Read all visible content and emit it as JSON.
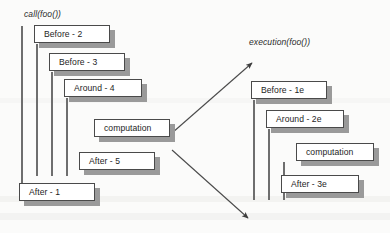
{
  "diagram": {
    "background_color": "#fbfbfa",
    "box_fill": "#ffffff",
    "box_border": "#4a4a4a",
    "shadow_color": "#9a9a9a",
    "lifeline_color": "#6e6e6e",
    "arrow_color": "#4a4a4a"
  },
  "left_group": {
    "caption": "call(foo())",
    "boxes": [
      {
        "label": "Before - 2",
        "x": 34,
        "y": 25,
        "w": 76,
        "h": 18
      },
      {
        "label": "Before - 3",
        "x": 49,
        "y": 53,
        "w": 76,
        "h": 18
      },
      {
        "label": "Around - 4",
        "x": 64,
        "y": 79,
        "w": 78,
        "h": 18
      },
      {
        "label": "computation",
        "x": 94,
        "y": 119,
        "w": 76,
        "h": 18
      },
      {
        "label": "After - 5",
        "x": 79,
        "y": 152,
        "w": 76,
        "h": 18
      },
      {
        "label": "After - 1",
        "x": 19,
        "y": 183,
        "w": 76,
        "h": 18
      }
    ],
    "lifelines": [
      {
        "x": 21,
        "y": 26,
        "h": 157
      },
      {
        "x": 36,
        "y": 44,
        "h": 132
      },
      {
        "x": 51,
        "y": 72,
        "h": 104
      },
      {
        "x": 66,
        "y": 98,
        "h": 78
      }
    ]
  },
  "right_group": {
    "caption": "execution(foo())",
    "boxes": [
      {
        "label": "Before - 1e",
        "x": 251,
        "y": 81,
        "w": 76,
        "h": 18
      },
      {
        "label": "Around - 2e",
        "x": 266,
        "y": 110,
        "w": 78,
        "h": 18
      },
      {
        "label": "computation",
        "x": 296,
        "y": 143,
        "w": 78,
        "h": 18
      },
      {
        "label": "After - 3e",
        "x": 281,
        "y": 175,
        "w": 78,
        "h": 18
      }
    ],
    "lifelines": [
      {
        "x": 253,
        "y": 100,
        "h": 100
      },
      {
        "x": 268,
        "y": 129,
        "h": 71
      },
      {
        "x": 283,
        "y": 162,
        "h": 38
      }
    ]
  },
  "arrows": [
    {
      "name": "call-to-execution-top",
      "x1": 172,
      "y1": 133,
      "x2": 252,
      "y2": 63
    },
    {
      "name": "call-to-execution-bottom",
      "x1": 172,
      "y1": 150,
      "x2": 248,
      "y2": 218
    }
  ],
  "captions_pos": {
    "left": {
      "x": 24,
      "y": 9
    },
    "right": {
      "x": 249,
      "y": 37
    }
  }
}
